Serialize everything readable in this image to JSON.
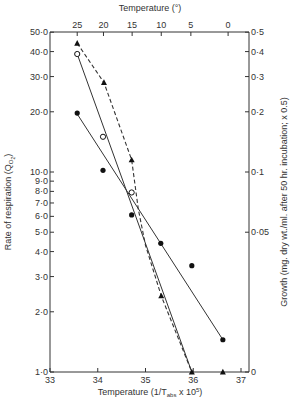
{
  "chart_data": {
    "type": "scatter",
    "title": "",
    "xlabel": "Temperature (1/T_abs x 10^5)",
    "xlabel_parts": {
      "main": "Temperature (1/T",
      "sub": "abs",
      "tail": " x 10",
      "sup": "5",
      "end": ")"
    },
    "top_xlabel": "Temperature (°)",
    "ylabel": "Rate of respiration (Q_O2)",
    "ylabel_parts": {
      "main": "Rate of respiration (Q",
      "sub": "O",
      "subsub": "2",
      "end": ")"
    },
    "y2label": "Growth (mg. dry wt./ml. after 50 hr. incubation; x 0.5)",
    "xlim": [
      33,
      37.2
    ],
    "ylim": [
      1.0,
      50.0
    ],
    "yscale": "log",
    "y2lim": [
      0,
      0.5
    ],
    "x_ticks": [
      33,
      34,
      35,
      36,
      37
    ],
    "x_tick_labels": [
      "33",
      "34",
      "35",
      "36",
      "37"
    ],
    "top_ticks": [
      {
        "label": "25",
        "x": 33.57
      },
      {
        "label": "20",
        "x": 34.12
      },
      {
        "label": "15",
        "x": 34.72
      },
      {
        "label": "10",
        "x": 35.33
      },
      {
        "label": "5",
        "x": 35.95
      },
      {
        "label": "0",
        "x": 36.73
      }
    ],
    "y_ticks": [
      {
        "label": "1·0",
        "v": 1
      },
      {
        "label": "2·0",
        "v": 2
      },
      {
        "label": "3·0",
        "v": 3
      },
      {
        "label": "4·0",
        "v": 4
      },
      {
        "label": "5·0",
        "v": 5
      },
      {
        "label": "6·0",
        "v": 6
      },
      {
        "label": "7·0",
        "v": 7
      },
      {
        "label": "8·0",
        "v": 8
      },
      {
        "label": "9·0",
        "v": 9
      },
      {
        "label": "10·0",
        "v": 10
      },
      {
        "label": "20·0",
        "v": 20
      },
      {
        "label": "30·0",
        "v": 30
      },
      {
        "label": "40·0",
        "v": 40
      },
      {
        "label": "50·0",
        "v": 50
      }
    ],
    "y2_ticks": [
      {
        "label": "0",
        "v": 0
      },
      {
        "label": "0·05",
        "v": 0.05
      },
      {
        "label": "0·1",
        "v": 0.1
      },
      {
        "label": "0·2",
        "v": 0.2
      },
      {
        "label": "0·3",
        "v": 0.3
      },
      {
        "label": "0·4",
        "v": 0.4
      },
      {
        "label": "0·5",
        "v": 0.5
      }
    ],
    "grid": false,
    "series": [
      {
        "name": "Respiration (filled circles)",
        "marker": "filled-circle",
        "line": "solid",
        "x": [
          33.57,
          34.11,
          34.71,
          35.32,
          35.97,
          36.62
        ],
        "y": [
          19.7,
          10.2,
          6.1,
          4.4,
          3.4,
          1.45
        ],
        "fit": [
          [
            33.57,
            19.5
          ],
          [
            36.62,
            1.45
          ]
        ]
      },
      {
        "name": "Respiration (open circles)",
        "marker": "open-circle",
        "line": "solid",
        "x": [
          33.57,
          34.11,
          34.71
        ],
        "y": [
          38.9,
          15.0,
          7.9
        ],
        "fit": [
          [
            33.57,
            38.9
          ],
          [
            35.97,
            1.0
          ]
        ]
      },
      {
        "name": "Growth (triangles)",
        "marker": "filled-triangle",
        "line": "dashed",
        "axis": "right",
        "x": [
          33.57,
          34.13,
          34.71,
          35.33,
          35.97,
          36.62
        ],
        "y": [
          0.44,
          0.28,
          0.115,
          0.024,
          0,
          0
        ],
        "curve": [
          [
            33.57,
            44
          ],
          [
            34.13,
            28
          ],
          [
            34.71,
            11.5
          ],
          [
            34.85,
            6.5
          ],
          [
            35.0,
            4.3
          ],
          [
            35.33,
            2.4
          ],
          [
            35.97,
            1.0
          ]
        ]
      }
    ]
  }
}
